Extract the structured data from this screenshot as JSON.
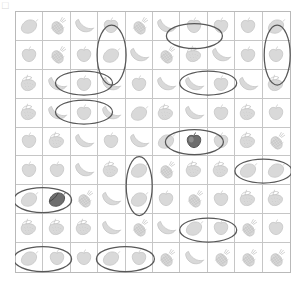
{
  "page": {
    "corner_mark": "□"
  },
  "grid": {
    "columns": 10,
    "rows": 9,
    "cell_width_px": 27.6,
    "cell_height_px": 29.1,
    "border_color": "#b9b9b9",
    "line_color": "#c6c6c6",
    "icon_color": "#d9d9d9",
    "icon_stroke": "#c0c0c0",
    "highlight_color": "#6e6e6e",
    "mark_color": "#585858",
    "legend": {
      "lemon": "lemon-icon",
      "pineapple": "pineapple-icon",
      "banana": "banana-icon",
      "apple": "apple-icon",
      "strawberry": "strawberry-icon"
    },
    "cells": [
      [
        {
          "fruit": "lemon"
        },
        {
          "fruit": "pineapple"
        },
        {
          "fruit": "banana"
        },
        {
          "fruit": "apple"
        },
        {
          "fruit": "pineapple"
        },
        {
          "fruit": "banana"
        },
        {
          "fruit": "apple"
        },
        {
          "fruit": "apple"
        },
        {
          "fruit": "apple"
        },
        {
          "fruit": "lemon"
        }
      ],
      [
        {
          "fruit": "apple"
        },
        {
          "fruit": "pineapple"
        },
        {
          "fruit": "apple"
        },
        {
          "fruit": "lemon"
        },
        {
          "fruit": "banana"
        },
        {
          "fruit": "pineapple"
        },
        {
          "fruit": "strawberry"
        },
        {
          "fruit": "banana"
        },
        {
          "fruit": "apple"
        },
        {
          "fruit": "apple"
        }
      ],
      [
        {
          "fruit": "strawberry"
        },
        {
          "fruit": "banana"
        },
        {
          "fruit": "apple"
        },
        {
          "fruit": "banana"
        },
        {
          "fruit": "apple"
        },
        {
          "fruit": "banana"
        },
        {
          "fruit": "banana"
        },
        {
          "fruit": "apple"
        },
        {
          "fruit": "banana"
        },
        {
          "fruit": "strawberry"
        }
      ],
      [
        {
          "fruit": "strawberry"
        },
        {
          "fruit": "banana"
        },
        {
          "fruit": "apple"
        },
        {
          "fruit": "banana"
        },
        {
          "fruit": "lemon"
        },
        {
          "fruit": "strawberry"
        },
        {
          "fruit": "banana"
        },
        {
          "fruit": "apple"
        },
        {
          "fruit": "strawberry"
        },
        {
          "fruit": "apple"
        }
      ],
      [
        {
          "fruit": "apple"
        },
        {
          "fruit": "strawberry"
        },
        {
          "fruit": "banana"
        },
        {
          "fruit": "apple"
        },
        {
          "fruit": "banana"
        },
        {
          "fruit": "lemon"
        },
        {
          "fruit": "apple",
          "shade": "dark"
        },
        {
          "fruit": "apple"
        },
        {
          "fruit": "strawberry"
        },
        {
          "fruit": "pineapple"
        }
      ],
      [
        {
          "fruit": "apple"
        },
        {
          "fruit": "apple"
        },
        {
          "fruit": "banana"
        },
        {
          "fruit": "strawberry"
        },
        {
          "fruit": "lemon"
        },
        {
          "fruit": "pineapple"
        },
        {
          "fruit": "strawberry"
        },
        {
          "fruit": "strawberry"
        },
        {
          "fruit": "lemon"
        },
        {
          "fruit": "lemon"
        }
      ],
      [
        {
          "fruit": "lemon"
        },
        {
          "fruit": "lemon",
          "shade": "dark"
        },
        {
          "fruit": "pineapple"
        },
        {
          "fruit": "banana"
        },
        {
          "fruit": "lemon"
        },
        {
          "fruit": "apple"
        },
        {
          "fruit": "pineapple"
        },
        {
          "fruit": "apple"
        },
        {
          "fruit": "strawberry"
        },
        {
          "fruit": "strawberry"
        }
      ],
      [
        {
          "fruit": "strawberry"
        },
        {
          "fruit": "strawberry"
        },
        {
          "fruit": "strawberry"
        },
        {
          "fruit": "banana"
        },
        {
          "fruit": "pineapple"
        },
        {
          "fruit": "banana"
        },
        {
          "fruit": "lemon"
        },
        {
          "fruit": "apple"
        },
        {
          "fruit": "pineapple"
        },
        {
          "fruit": "apple"
        }
      ],
      [
        {
          "fruit": "lemon"
        },
        {
          "fruit": "apple"
        },
        {
          "fruit": "apple"
        },
        {
          "fruit": "lemon"
        },
        {
          "fruit": "apple"
        },
        {
          "fruit": "pineapple"
        },
        {
          "fruit": "banana"
        },
        {
          "fruit": "pineapple"
        },
        {
          "fruit": "pineapple"
        },
        {
          "fruit": "pineapple"
        }
      ]
    ]
  },
  "marks": {
    "description": "hand-drawn ellipses circling selected cells",
    "count": 13,
    "items": [
      {
        "name": "mark-r1c4-vertical",
        "cx": 96.6,
        "cy": 44.0,
        "rx": 14.5,
        "ry": 30.0,
        "orientation": "vertical"
      },
      {
        "name": "mark-r1c6c7-horizontal",
        "cx": 179.4,
        "cy": 25.0,
        "rx": 28.0,
        "ry": 12.5,
        "orientation": "horizontal"
      },
      {
        "name": "mark-r1c10-vertical",
        "cx": 262.2,
        "cy": 44.0,
        "rx": 13.0,
        "ry": 30.0,
        "orientation": "vertical"
      },
      {
        "name": "mark-r3c2c3-horizontal",
        "cx": 69.0,
        "cy": 72.0,
        "rx": 28.5,
        "ry": 12.0,
        "orientation": "horizontal"
      },
      {
        "name": "mark-r3c7c8-horizontal",
        "cx": 193.2,
        "cy": 72.0,
        "rx": 28.5,
        "ry": 12.0,
        "orientation": "horizontal"
      },
      {
        "name": "mark-r4c2c3-horizontal",
        "cx": 69.0,
        "cy": 101.0,
        "rx": 28.5,
        "ry": 12.0,
        "orientation": "horizontal"
      },
      {
        "name": "mark-r5c6c7-horizontal",
        "cx": 179.4,
        "cy": 131.0,
        "rx": 29.0,
        "ry": 12.5,
        "orientation": "horizontal"
      },
      {
        "name": "mark-r6c9c10-horizontal",
        "cx": 248.4,
        "cy": 160.0,
        "rx": 28.5,
        "ry": 12.0,
        "orientation": "horizontal"
      },
      {
        "name": "mark-r6r7c5-vertical",
        "cx": 124.2,
        "cy": 175.0,
        "rx": 13.0,
        "ry": 29.5,
        "orientation": "vertical"
      },
      {
        "name": "mark-r7c1c2-horizontal",
        "cx": 27.6,
        "cy": 189.0,
        "rx": 29.0,
        "ry": 12.5,
        "orientation": "horizontal"
      },
      {
        "name": "mark-r8c7c8-horizontal",
        "cx": 193.2,
        "cy": 219.0,
        "rx": 28.5,
        "ry": 12.0,
        "orientation": "horizontal"
      },
      {
        "name": "mark-r9c1c2-horizontal",
        "cx": 27.6,
        "cy": 248.0,
        "rx": 29.0,
        "ry": 12.5,
        "orientation": "horizontal"
      },
      {
        "name": "mark-r9c4c5-horizontal",
        "cx": 110.4,
        "cy": 248.0,
        "rx": 29.0,
        "ry": 12.5,
        "orientation": "horizontal"
      }
    ]
  }
}
